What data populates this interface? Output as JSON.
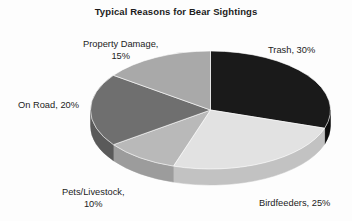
{
  "chart_data": {
    "type": "pie",
    "title": "Typical Reasons for Bear Sightings",
    "xlabel": "",
    "ylabel": "",
    "legend_position": "none",
    "grid": false,
    "three_d": true,
    "start_angle_deg": 0,
    "direction": "clockwise",
    "categories": [
      "Trash",
      "Birdfeeders",
      "Pets/Livestock",
      "On Road",
      "Property Damage"
    ],
    "values": [
      30,
      25,
      10,
      20,
      15
    ],
    "units": "%",
    "slices": [
      {
        "name": "Trash",
        "value": 30,
        "label": "Trash, 30%",
        "color": "#1a1a1a",
        "side_color": "#0d0d0d"
      },
      {
        "name": "Birdfeeders",
        "value": 25,
        "label": "Birdfeeders, 25%",
        "color": "#e2e2e2",
        "side_color": "#c2c2c2"
      },
      {
        "name": "Pets/Livestock",
        "value": 10,
        "label_line1": "Pets/Livestock,",
        "label_line2": "10%",
        "color": "#b9b9b9",
        "side_color": "#9c9c9c"
      },
      {
        "name": "On Road",
        "value": 20,
        "label": "On Road, 20%",
        "color": "#6f6f6f",
        "side_color": "#5a5a5a"
      },
      {
        "name": "Property Damage",
        "value": 15,
        "label_line1": "Property Damage,",
        "label_line2": "15%",
        "color": "#a9a9a9",
        "side_color": "#8e8e8e"
      }
    ]
  },
  "title": {
    "text": "Typical Reasons for Bear Sightings"
  },
  "labels": {
    "trash": "Trash, 30%",
    "birdfeeders": "Birdfeeders, 25%",
    "pets_line1": "Pets/Livestock,",
    "pets_line2": "10%",
    "on_road": "On Road, 20%",
    "property_line1": "Property Damage,",
    "property_line2": "15%"
  },
  "colors": {
    "trash": "#1a1a1a",
    "birdfeeders": "#e2e2e2",
    "pets": "#b9b9b9",
    "on_road": "#6f6f6f",
    "property": "#a9a9a9",
    "background": "#fdfdfd",
    "text": "#1c1c1c"
  }
}
